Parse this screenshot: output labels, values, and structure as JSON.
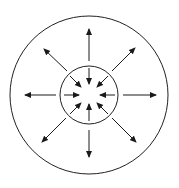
{
  "diagram": {
    "colors": {
      "background": "#ffffff",
      "stroke": "#222222",
      "arrow": "#1a1a1a"
    },
    "center": [
      89,
      95
    ],
    "outer_circle": {
      "cx": 89,
      "cy": 95,
      "r": 79
    },
    "inner_circle": {
      "cx": 89,
      "cy": 95,
      "r": 29
    },
    "inward_arrows": [
      {
        "direction": "from-top",
        "x1": 89,
        "y1": 68,
        "x2": 89,
        "y2": 84
      },
      {
        "direction": "from-top-right",
        "x1": 108,
        "y1": 76,
        "x2": 97,
        "y2": 87
      },
      {
        "direction": "from-right",
        "x1": 115,
        "y1": 95,
        "x2": 100,
        "y2": 95
      },
      {
        "direction": "from-bottom-right",
        "x1": 108,
        "y1": 114,
        "x2": 97,
        "y2": 103
      },
      {
        "direction": "from-bottom",
        "x1": 89,
        "y1": 121,
        "x2": 89,
        "y2": 104
      },
      {
        "direction": "from-bottom-left",
        "x1": 70,
        "y1": 114,
        "x2": 81,
        "y2": 103
      },
      {
        "direction": "from-left",
        "x1": 64,
        "y1": 95,
        "x2": 79,
        "y2": 95
      },
      {
        "direction": "from-top-left",
        "x1": 70,
        "y1": 76,
        "x2": 81,
        "y2": 87
      }
    ],
    "outward_arrows": [
      {
        "direction": "to-top",
        "x1": 89,
        "y1": 61,
        "x2": 89,
        "y2": 29
      },
      {
        "direction": "to-top-right",
        "x1": 112,
        "y1": 71,
        "x2": 135,
        "y2": 48
      },
      {
        "direction": "to-right",
        "x1": 123,
        "y1": 95,
        "x2": 156,
        "y2": 95
      },
      {
        "direction": "to-bottom-right",
        "x1": 112,
        "y1": 118,
        "x2": 136,
        "y2": 142
      },
      {
        "direction": "to-bottom",
        "x1": 89,
        "y1": 130,
        "x2": 89,
        "y2": 157
      },
      {
        "direction": "to-bottom-left",
        "x1": 66,
        "y1": 118,
        "x2": 42,
        "y2": 142
      },
      {
        "direction": "to-left",
        "x1": 56,
        "y1": 95,
        "x2": 25,
        "y2": 95
      },
      {
        "direction": "to-top-left",
        "x1": 67,
        "y1": 71,
        "x2": 44,
        "y2": 49
      }
    ]
  }
}
